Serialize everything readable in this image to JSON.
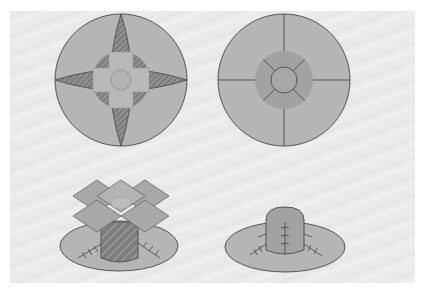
{
  "figure": {
    "panels": [
      {
        "id": "top-left",
        "label": "Flat circle with four-point star darts and square cross center"
      },
      {
        "id": "top-right",
        "label": "Flat circle divided into quarters with inner ring and center circle"
      },
      {
        "id": "bottom-left",
        "label": "Assembled brim with cylinder crown and cross-shaped flaps folded open"
      },
      {
        "id": "bottom-right",
        "label": "Assembled hat with rounded crown and stitched seams"
      }
    ]
  },
  "colors": {
    "background": "#e9e9e9",
    "fill_light": "#b8b8b8",
    "fill_mid": "#a6a6a6",
    "fill_dark": "#8a8a8a",
    "stroke": "#555555"
  }
}
